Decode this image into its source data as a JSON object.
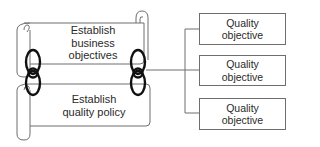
{
  "diagram": {
    "scrolls": [
      {
        "id": "business",
        "line1": "Establish",
        "line2": "business",
        "line3": "objectives"
      },
      {
        "id": "policy",
        "line1": "Establish",
        "line2": "quality policy"
      }
    ],
    "objectives": [
      {
        "line1": "Quality",
        "line2": "objective"
      },
      {
        "line1": "Quality",
        "line2": "objective"
      },
      {
        "line1": "Quality",
        "line2": "objective"
      }
    ],
    "colors": {
      "stroke": "#6e6e6e",
      "link": "#111111",
      "text": "#2a2a2a"
    }
  }
}
